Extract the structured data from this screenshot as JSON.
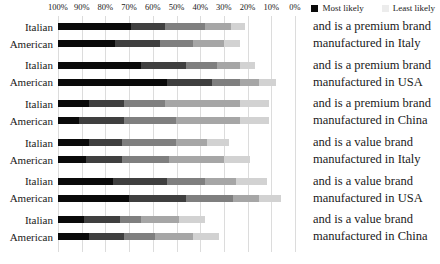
{
  "legend": {
    "items": [
      {
        "label": "Most likely",
        "swatch": "#0a0a0a"
      },
      {
        "label": "Least likely",
        "swatch": "#ececec"
      }
    ]
  },
  "axis": {
    "ticks": [
      "100%",
      "90%",
      "80%",
      "70%",
      "60%",
      "50%",
      "40%",
      "30%",
      "20%",
      "10%",
      "0%"
    ]
  },
  "row_categories": [
    "Italian",
    "American"
  ],
  "chart_data": {
    "type": "bar",
    "subtype": "horizontal-stacked-ranking",
    "title": "",
    "xlabel": "",
    "ylabel": "",
    "axis_range": [
      100,
      0
    ],
    "axis_reversed": true,
    "grid": true,
    "gridline_color": "#dcdcdc",
    "legend_position": "top-right",
    "rank_scale": [
      "Most likely",
      "Least likely"
    ],
    "rank_colors": [
      "#0a0a0a",
      "#3f3f3f",
      "#7f7f7f",
      "#a6a6a6",
      "#d2d2d2",
      "transparent"
    ],
    "groups": [
      {
        "scenario_lines": [
          "and is a premium brand",
          "manufactured in Italy"
        ],
        "series": [
          {
            "name": "Italian",
            "values": [
              31,
              14,
              17,
              11,
              6,
              21
            ]
          },
          {
            "name": "American",
            "values": [
              24,
              19,
              14,
              13,
              7,
              23
            ]
          }
        ]
      },
      {
        "scenario_lines": [
          "and is a premium brand",
          "manufactured in USA"
        ],
        "series": [
          {
            "name": "Italian",
            "values": [
              35,
              19,
              13,
              10,
              6,
              17
            ]
          },
          {
            "name": "American",
            "values": [
              46,
              19,
              12,
              8,
              7,
              8
            ]
          }
        ]
      },
      {
        "scenario_lines": [
          "and is a premium brand",
          "manufactured in China"
        ],
        "series": [
          {
            "name": "Italian",
            "values": [
              13,
              15,
              17,
              32,
              12,
              11
            ]
          },
          {
            "name": "American",
            "values": [
              9,
              19,
              22,
              27,
              12,
              11
            ]
          }
        ]
      },
      {
        "scenario_lines": [
          "and is a value brand",
          "manufactured in Italy"
        ],
        "series": [
          {
            "name": "Italian",
            "values": [
              13,
              14,
              23,
              13,
              9,
              28
            ]
          },
          {
            "name": "American",
            "values": [
              12,
              15,
              20,
              23,
              11,
              19
            ]
          }
        ]
      },
      {
        "scenario_lines": [
          "and is a value brand",
          "manufactured in USA"
        ],
        "series": [
          {
            "name": "Italian",
            "values": [
              23,
              23,
              16,
              13,
              13,
              12
            ]
          },
          {
            "name": "American",
            "values": [
              30,
              24,
              20,
              11,
              9,
              6
            ]
          }
        ]
      },
      {
        "scenario_lines": [
          "and is a value brand",
          "manufactured in China"
        ],
        "series": [
          {
            "name": "Italian",
            "values": [
              11,
              15,
              9,
              16,
              11,
              38
            ]
          },
          {
            "name": "American",
            "values": [
              13,
              15,
              13,
              16,
              11,
              32
            ]
          }
        ]
      }
    ]
  }
}
